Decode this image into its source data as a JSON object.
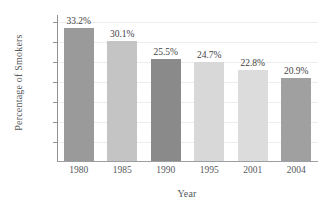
{
  "chart_data": {
    "type": "bar",
    "title": "",
    "xlabel": "Year",
    "ylabel": "Percentage of Smokers",
    "categories": [
      "1980",
      "1985",
      "1990",
      "1995",
      "2001",
      "2004"
    ],
    "values": [
      33.2,
      30.1,
      25.5,
      24.7,
      22.8,
      20.9
    ],
    "value_labels": [
      "33.2%",
      "30.1%",
      "25.5%",
      "24.7%",
      "22.8%",
      "20.9%"
    ],
    "bar_colors": [
      "#9a9a9a",
      "#c4c4c4",
      "#8a8a8a",
      "#d8d8d8",
      "#dcdcdc",
      "#a0a0a0"
    ],
    "ylim": [
      0,
      36.8
    ],
    "yticks": [
      5,
      10,
      15,
      20,
      25,
      30,
      35
    ],
    "ytick_labels": [
      "5%",
      "10%",
      "15%",
      "20%",
      "25%",
      "30%",
      "35%"
    ],
    "grid": true,
    "grid_color": "#ededee",
    "legend": null,
    "axis_color": "#8e9295",
    "text_color": "#55595c",
    "background": "#ffffff"
  }
}
